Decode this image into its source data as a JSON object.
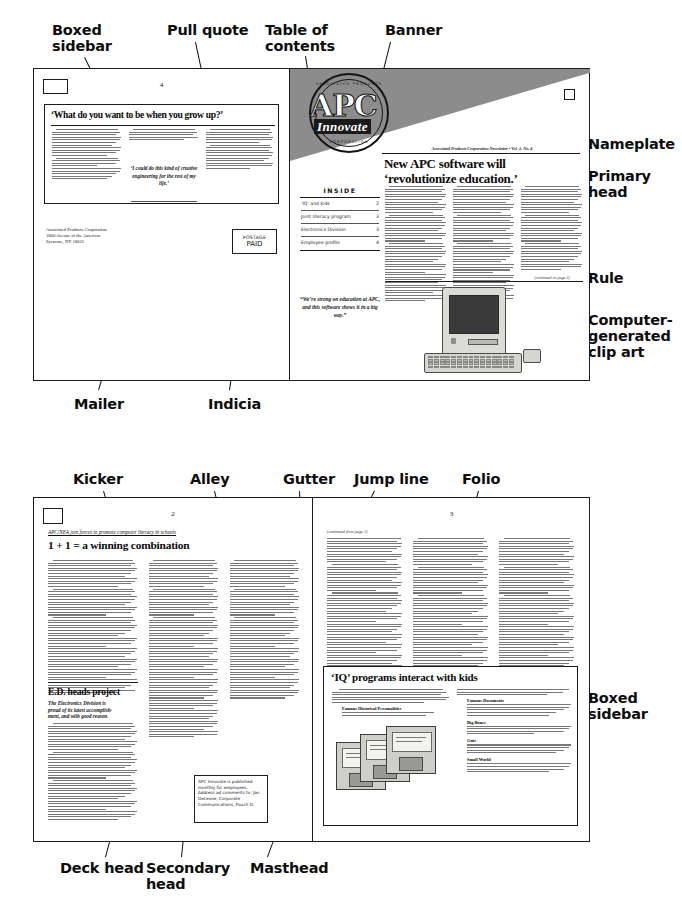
{
  "annotations": [
    {
      "id": "boxed-sidebar-top",
      "label": "Boxed\nsidebar"
    },
    {
      "id": "pull-quote",
      "label": "Pull quote"
    },
    {
      "id": "table-of-contents",
      "label": "Table of\ncontents"
    },
    {
      "id": "banner",
      "label": "Banner"
    },
    {
      "id": "nameplate",
      "label": "Nameplate"
    },
    {
      "id": "primary-head",
      "label": "Primary\nhead"
    },
    {
      "id": "rule",
      "label": "Rule"
    },
    {
      "id": "clip-art",
      "label": "Computer-\ngenerated\nclip art"
    },
    {
      "id": "mailer",
      "label": "Mailer"
    },
    {
      "id": "indicia",
      "label": "Indicia"
    },
    {
      "id": "kicker",
      "label": "Kicker"
    },
    {
      "id": "alley",
      "label": "Alley"
    },
    {
      "id": "gutter",
      "label": "Gutter"
    },
    {
      "id": "jump-line",
      "label": "Jump line"
    },
    {
      "id": "folio",
      "label": "Folio"
    },
    {
      "id": "boxed-sidebar-bottom",
      "label": "Boxed\nsidebar"
    },
    {
      "id": "deck-head",
      "label": "Deck head"
    },
    {
      "id": "secondary-head",
      "label": "Secondary\nhead"
    },
    {
      "id": "masthead",
      "label": "Masthead"
    }
  ],
  "spread_top": {
    "left_page": {
      "folio": "4",
      "sidebar": {
        "headline": "‘What do you want to be when you grow up?’",
        "pull_quote": "‘I could do this kind of creative engineering for the rest of my life.’"
      },
      "mailer": {
        "line1": "Associated Products Corporation",
        "line2": "1800 Avenue of the Americas",
        "line3": "Syracuse, NY 10025"
      },
      "indicia": {
        "line1": "POSTAGE",
        "line2": "PAID"
      }
    },
    "right_page": {
      "banner": {
        "logo_word": "APC",
        "logo_script": "Innovate",
        "seal_top_text": "ASSOCIATED PRODUCTS",
        "seal_bottom_text": "CORPORATION"
      },
      "nameplate": "Associated Products Corporation Newsletter • Vol. 2, No. 4",
      "primary_head_line1": "New APC software will",
      "primary_head_line2": "‘revolutionize education.’",
      "toc": {
        "title": "INSIDE",
        "items": [
          {
            "label": "‘IQ’ and kids",
            "page": "2"
          },
          {
            "label": "Joint literacy program",
            "page": "3"
          },
          {
            "label": "Electronics Division",
            "page": "3"
          },
          {
            "label": "Employee profile",
            "page": "4"
          }
        ]
      },
      "pull_quote": "“We’re strong on education at APC, and this software shows it in a big way.”",
      "continued_line": "(continued on page 2)",
      "clip_art_name": "macintosh-computer-clip-art"
    }
  },
  "spread_bottom": {
    "left_page": {
      "folio": "2",
      "kicker": "APC/NEA join forces to promote computer literacy in schools",
      "primary_head": "1 + 1 =  a winning combination",
      "secondary_head": "E.D. heads project",
      "deck_line1": "The Electronics Division is",
      "deck_line2": "proud of its latest accomplish-",
      "deck_line3": "ment, and with good reason.",
      "masthead": "APC Innovate is published monthly for employees. Address ad comments to: Jan DeLeone, Corporate Communications, Pouch D."
    },
    "right_page": {
      "folio": "3",
      "jump_line": "(continued from page 1)",
      "sidebar": {
        "headline": "‘IQ’ programs interact with kids",
        "bullets": [
          "Famous Historical Personalities",
          "Famous Documents",
          "Big Bones",
          "Guts",
          "Small World"
        ],
        "clip_art_name": "floppy-disks-clip-art"
      }
    }
  },
  "colors": {
    "banner_gray": "#8c8c8c",
    "ink": "#111111",
    "rule": "#1b1b1b",
    "body_text_gray": "#6d6d6d"
  }
}
